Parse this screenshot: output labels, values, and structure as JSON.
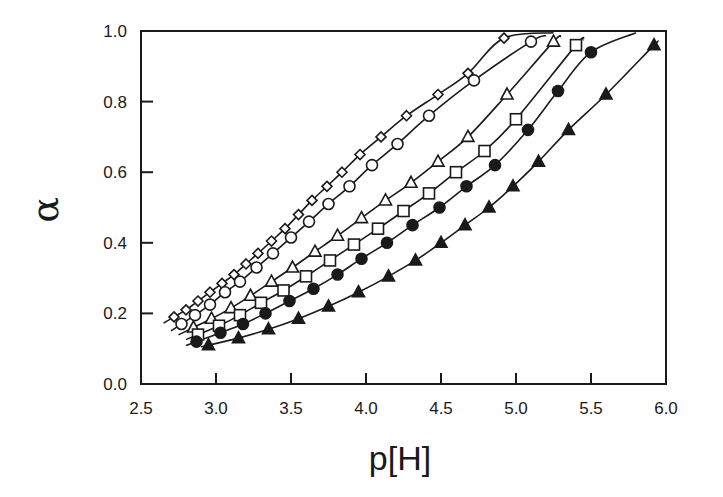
{
  "chart_data": {
    "type": "scatter",
    "title": "",
    "xlabel": "p[H]",
    "ylabel": "α",
    "xlim": [
      2.5,
      6.0
    ],
    "ylim": [
      0.0,
      1.0
    ],
    "grid": false,
    "legend": "none",
    "x_ticks": [
      "2.5",
      "3.0",
      "3.5",
      "4.0",
      "4.5",
      "5.0",
      "5.5",
      "6.0"
    ],
    "y_ticks": [
      "0.0",
      "0.2",
      "0.4",
      "0.6",
      "0.8",
      "1.0"
    ],
    "series": [
      {
        "name": "series-1",
        "marker": "diamond-open",
        "line": "fit-curve",
        "curve_range": [
          2.65,
          5.25
        ],
        "x": [
          2.72,
          2.8,
          2.88,
          2.96,
          3.04,
          3.12,
          3.2,
          3.28,
          3.37,
          3.46,
          3.55,
          3.64,
          3.74,
          3.84,
          3.96,
          4.1,
          4.27,
          4.48,
          4.68,
          4.92
        ],
        "y": [
          0.19,
          0.21,
          0.235,
          0.26,
          0.285,
          0.31,
          0.34,
          0.37,
          0.405,
          0.44,
          0.48,
          0.52,
          0.56,
          0.6,
          0.65,
          0.7,
          0.76,
          0.82,
          0.88,
          0.98
        ]
      },
      {
        "name": "series-2",
        "marker": "circle-open",
        "line": "fit-curve",
        "curve_range": [
          2.7,
          5.2
        ],
        "x": [
          2.77,
          2.86,
          2.96,
          3.06,
          3.16,
          3.27,
          3.38,
          3.5,
          3.62,
          3.75,
          3.89,
          4.04,
          4.21,
          4.42,
          4.72,
          5.1
        ],
        "y": [
          0.17,
          0.195,
          0.225,
          0.26,
          0.29,
          0.33,
          0.37,
          0.415,
          0.46,
          0.51,
          0.56,
          0.62,
          0.68,
          0.76,
          0.86,
          0.97
        ]
      },
      {
        "name": "series-3",
        "marker": "triangle-open",
        "line": "fit-curve",
        "curve_range": [
          2.75,
          5.3
        ],
        "x": [
          2.85,
          2.97,
          3.1,
          3.23,
          3.37,
          3.51,
          3.66,
          3.81,
          3.97,
          4.13,
          4.3,
          4.48,
          4.68,
          4.94,
          5.25
        ],
        "y": [
          0.16,
          0.185,
          0.215,
          0.25,
          0.29,
          0.33,
          0.375,
          0.42,
          0.47,
          0.52,
          0.57,
          0.63,
          0.7,
          0.82,
          0.97
        ]
      },
      {
        "name": "series-4",
        "marker": "square-open",
        "line": "fit-curve",
        "curve_range": [
          2.8,
          5.45
        ],
        "x": [
          2.88,
          3.02,
          3.16,
          3.3,
          3.45,
          3.6,
          3.76,
          3.92,
          4.08,
          4.25,
          4.42,
          4.6,
          4.79,
          5.0,
          5.4
        ],
        "y": [
          0.14,
          0.165,
          0.195,
          0.23,
          0.265,
          0.305,
          0.35,
          0.395,
          0.44,
          0.49,
          0.54,
          0.6,
          0.66,
          0.75,
          0.96
        ]
      },
      {
        "name": "series-5",
        "marker": "circle-filled",
        "line": "fit-curve",
        "curve_range": [
          2.8,
          5.8
        ],
        "x": [
          2.87,
          3.03,
          3.18,
          3.33,
          3.49,
          3.65,
          3.81,
          3.97,
          4.14,
          4.31,
          4.49,
          4.67,
          4.86,
          5.08,
          5.28,
          5.5
        ],
        "y": [
          0.12,
          0.145,
          0.17,
          0.2,
          0.235,
          0.27,
          0.31,
          0.355,
          0.4,
          0.45,
          0.5,
          0.56,
          0.62,
          0.72,
          0.83,
          0.94
        ]
      },
      {
        "name": "series-6",
        "marker": "triangle-filled",
        "line": "fit-curve",
        "curve_range": [
          2.9,
          5.93
        ],
        "x": [
          2.95,
          3.15,
          3.35,
          3.55,
          3.75,
          3.95,
          4.15,
          4.33,
          4.5,
          4.66,
          4.82,
          4.98,
          5.15,
          5.35,
          5.6,
          5.92
        ],
        "y": [
          0.11,
          0.13,
          0.155,
          0.185,
          0.22,
          0.26,
          0.305,
          0.35,
          0.4,
          0.45,
          0.5,
          0.56,
          0.63,
          0.72,
          0.82,
          0.96
        ]
      }
    ]
  }
}
